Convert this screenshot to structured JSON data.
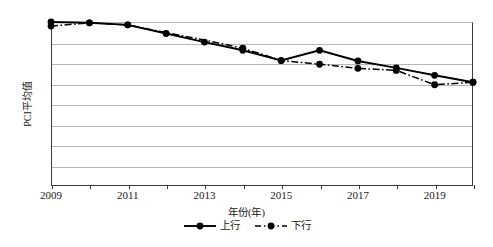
{
  "chart_data": {
    "type": "line",
    "title": "",
    "xlabel": "年份(年)",
    "ylabel": "PCI平均值",
    "xlim": [
      2009,
      2020
    ],
    "ylim": [
      60,
      100
    ],
    "ytick_labels": [
      "100",
      "95",
      "90",
      "85",
      "80",
      "75",
      "70",
      "65",
      "60"
    ],
    "ytick_values": [
      100,
      95,
      90,
      85,
      80,
      75,
      70,
      65,
      60
    ],
    "xtick_labels": [
      "2009",
      "2011",
      "2013",
      "2015",
      "2017",
      "2019"
    ],
    "xtick_values": [
      2009,
      2011,
      2013,
      2015,
      2017,
      2019
    ],
    "x": [
      2009,
      2010,
      2011,
      2012,
      2013,
      2014,
      2015,
      2016,
      2017,
      2018,
      2019,
      2020
    ],
    "grid": "horizontal",
    "legend_position": "bottom-center",
    "series": [
      {
        "name": "上行",
        "style": "solid",
        "marker": "filled-circle",
        "color": "#000000",
        "values": [
          100.0,
          99.8,
          99.3,
          97.2,
          95.1,
          93.1,
          90.6,
          93.1,
          90.5,
          88.8,
          87.0,
          85.3
        ]
      },
      {
        "name": "下行",
        "style": "dash-dot",
        "marker": "filled-circle",
        "color": "#000000",
        "values": [
          99.0,
          99.8,
          99.3,
          97.4,
          95.6,
          93.6,
          90.6,
          89.7,
          88.7,
          88.2,
          84.7,
          85.3
        ]
      }
    ]
  },
  "axis": {
    "y_title": "PCI平均值",
    "x_title": "年份(年)"
  },
  "legend": {
    "items": [
      {
        "label": "上行",
        "style": "solid"
      },
      {
        "label": "下行",
        "style": "dash-dot"
      }
    ]
  }
}
